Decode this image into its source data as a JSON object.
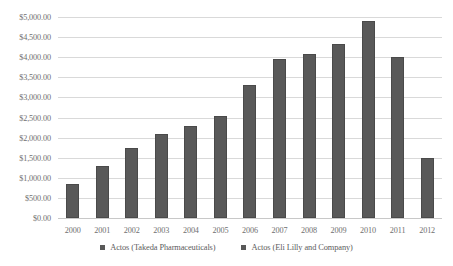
{
  "chart_data": {
    "type": "bar",
    "title": "",
    "xlabel": "",
    "ylabel": "",
    "ylim": [
      0,
      5000
    ],
    "ytick_step": 500,
    "grid": true,
    "legend_position": "bottom",
    "categories": [
      "2000",
      "2001",
      "2002",
      "2003",
      "2004",
      "2005",
      "2006",
      "2007",
      "2008",
      "2009",
      "2010",
      "2011",
      "2012"
    ],
    "ytick_labels": [
      "$5,000.00",
      "$4,500.00",
      "$4,000.00",
      "$3,500.00",
      "$3,000.00",
      "$2,500.00",
      "$2,000.00",
      "$1,500.00",
      "$1,000.00",
      "$500.00",
      "$0.00"
    ],
    "ytick_values": [
      5000,
      4500,
      4000,
      3500,
      3000,
      2500,
      2000,
      1500,
      1000,
      500,
      0
    ],
    "series": [
      {
        "name": "Actos (Takeda Pharmaceuticals)",
        "values": [
          850,
          1300,
          1750,
          2100,
          2300,
          2550,
          3300,
          3950,
          4075,
          4325,
          4900,
          4000,
          1500
        ]
      }
    ],
    "legend": [
      {
        "label": "Actos (Takeda Pharmaceuticals)",
        "color": "#595959"
      },
      {
        "label": "Actos  (Eli Lilly and Company)",
        "color": "#595959"
      }
    ],
    "colors": {
      "bar": "#595959",
      "gridline": "#d9d9d9",
      "text": "#6f6f6f"
    }
  }
}
